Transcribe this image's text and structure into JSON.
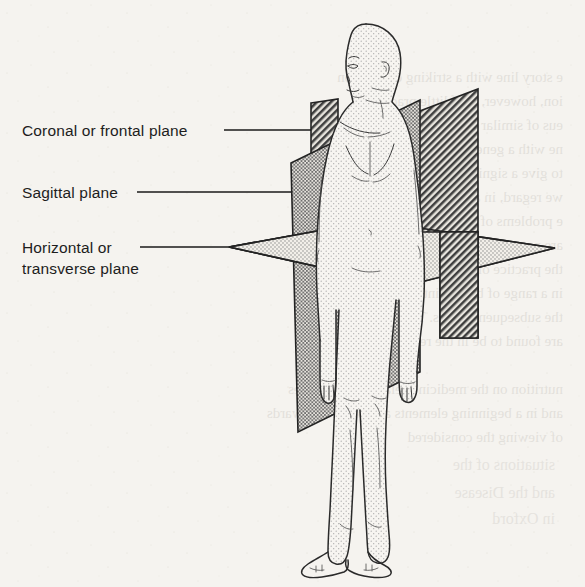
{
  "document": {
    "type": "scanned-textbook-figure",
    "caption_present": false,
    "page_background_hex": "#f5f3ef",
    "ink_hex": "#1d1d1d",
    "description": "Line drawing of a standing human figure intersected by the three principal anatomical reference planes, each rendered with a different halftone screen."
  },
  "labels": [
    {
      "id": "coronal",
      "lines": [
        "Coronal or frontal plane"
      ],
      "text_x": 22,
      "baseline_y": 136,
      "leader": {
        "x1": 224,
        "y1": 130,
        "x2": 311,
        "y2": 130
      },
      "points_to": "coronal-plane"
    },
    {
      "id": "sagittal",
      "lines": [
        "Sagittal plane"
      ],
      "text_x": 22,
      "baseline_y": 198,
      "leader": {
        "x1": 137,
        "y1": 192,
        "x2": 291,
        "y2": 192
      },
      "points_to": "sagittal-plane"
    },
    {
      "id": "horizontal",
      "lines": [
        "Horizontal or",
        "transverse plane"
      ],
      "text_x": 22,
      "baseline_y": 253,
      "line_height": 21,
      "leader": {
        "x1": 140,
        "y1": 247,
        "x2": 229,
        "y2": 247
      },
      "points_to": "horizontal-plane"
    }
  ],
  "planes": [
    {
      "id": "coronal-plane",
      "name": "Coronal or frontal plane",
      "alt_name": "frontal plane",
      "fill_pattern": "diagonal-hatch-dark",
      "tone": "dark",
      "orientation": "vertical, divides body into anterior and posterior"
    },
    {
      "id": "sagittal-plane",
      "name": "Sagittal plane",
      "fill_pattern": "dot-screen-medium",
      "tone": "medium",
      "orientation": "vertical, divides body into left and right"
    },
    {
      "id": "horizontal-plane",
      "name": "Horizontal or transverse plane",
      "alt_name": "transverse plane",
      "fill_pattern": "dot-screen-light",
      "tone": "light",
      "orientation": "horizontal, divides body into superior and inferior"
    }
  ],
  "figure": {
    "id": "human-figure",
    "name": "standing human figure",
    "pose": "anatomical standing position, arms at sides, facing three-quarter left",
    "shading": "halftone dot stipple"
  },
  "ghost_text": {
    "present": true,
    "description": "faint mirrored show-through text from the reverse side of the page",
    "legible": false
  }
}
